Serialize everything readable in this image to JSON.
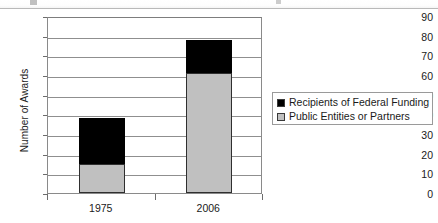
{
  "chart_data": {
    "type": "bar",
    "subtype": "stacked-bar",
    "title": "",
    "xlabel": "",
    "ylabel": "Number of Awards",
    "categories": [
      "1975",
      "2006"
    ],
    "series": [
      {
        "name": "Public Entities or Partners",
        "color": "#C0C0C0",
        "values": [
          15,
          61
        ]
      },
      {
        "name": "Recipients of Federal Funding",
        "color": "#000000",
        "values": [
          23,
          17
        ]
      }
    ],
    "totals": [
      38,
      78
    ],
    "ylim": [
      0,
      90
    ],
    "ytick_step": 10,
    "yticks": [
      90,
      80,
      70,
      60,
      50,
      40,
      30,
      20,
      10,
      0
    ],
    "grid": true,
    "grid_axis": "y",
    "legend_position": "right",
    "legend_entries": [
      {
        "label": "Recipients of Federal Funding",
        "color": "#000000"
      },
      {
        "label": "Public Entities or Partners",
        "color": "#C0C0C0"
      }
    ]
  }
}
